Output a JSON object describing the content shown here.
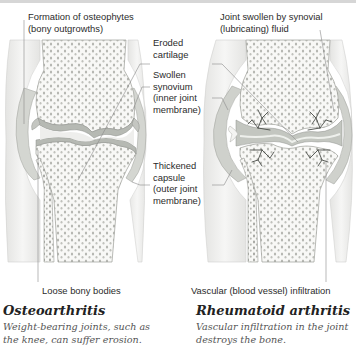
{
  "colors": {
    "bone_fill": "#f7f7f5",
    "bone_dots": "#a9aaa6",
    "cartilage": "#b9bcb6",
    "soft_tissue": "#ececea",
    "capsule": "#c9cbc6",
    "vessel": "#4a4d48",
    "leader_line": "#8a8a8a",
    "label_text": "#2b2b2b",
    "desc_text": "#555555"
  },
  "left_panel": {
    "title": "Osteoarthritis",
    "description": "Weight-bearing joints, such as\nthe knee, can suffer erosion.",
    "labels": {
      "osteophytes": "Formation of osteophytes\n(bony outgrowths)",
      "loose_bodies": "Loose bony bodies"
    }
  },
  "center_labels": {
    "eroded_cartilage": "Eroded\ncartilage",
    "swollen_synovium": "Swollen\nsynovium\n(inner joint\nmembrane)",
    "thickened_capsule": "Thickened\ncapsule\n(outer joint\nmembrane)"
  },
  "right_panel": {
    "title": "Rheumatoid arthritis",
    "description": "Vascular infiltration in the joint\ndestroys the bone.",
    "labels": {
      "joint_swollen": "Joint swollen by synovial\n(lubricating) fluid",
      "vascular": "Vascular (blood vessel) infiltration"
    }
  }
}
